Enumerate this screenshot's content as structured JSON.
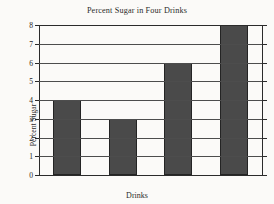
{
  "chart_data": {
    "type": "bar",
    "title": "Percent Sugar in Four Drinks",
    "xlabel": "Drinks",
    "ylabel": "Percent Sugar",
    "categories": [
      "A",
      "B",
      "C",
      "D"
    ],
    "values": [
      4,
      3,
      6,
      8
    ],
    "ylim": [
      0,
      8
    ],
    "yticks": [
      0,
      1,
      2,
      3,
      4,
      5,
      6,
      7,
      8
    ],
    "ytick_labels": [
      "0",
      "1",
      "2",
      "3",
      "4",
      "5",
      "6",
      "7",
      "8"
    ],
    "grid": "horizontal",
    "legend": "none",
    "bar_color": "#4a4a4a",
    "bar_edge_color": "#242424",
    "axis_color": "#2b2b2b",
    "background_color": "#fbfaf8"
  }
}
